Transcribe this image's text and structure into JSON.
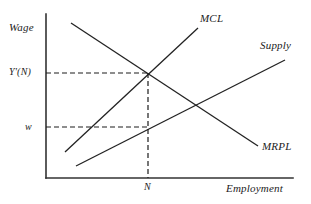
{
  "figure": {
    "type": "economics-diagram",
    "background_color": "#ffffff",
    "line_color": "#222222"
  },
  "axes": {
    "y_axis_label": "Wage",
    "x_axis_label": "Employment",
    "origin": {
      "x": 46,
      "y": 178
    },
    "y_axis_top": {
      "x": 46,
      "y": 14
    },
    "x_axis_right": {
      "x": 293,
      "y": 178
    }
  },
  "curves": [
    {
      "name": "MCL",
      "label": "MCL",
      "description": "marginal cost of labour, upward sloping, steep",
      "x1": 65,
      "y1": 152,
      "x2": 198,
      "y2": 28,
      "label_x": 200,
      "label_y": 13
    },
    {
      "name": "Supply",
      "label": "Supply",
      "description": "labour supply curve, upward sloping, shallow",
      "x1": 76,
      "y1": 166,
      "x2": 285,
      "y2": 60,
      "label_x": 260,
      "label_y": 40
    },
    {
      "name": "MRPL",
      "label": "MRPL",
      "description": "marginal revenue product of labour, downward sloping",
      "x1": 71,
      "y1": 23,
      "x2": 258,
      "y2": 146,
      "label_x": 262,
      "label_y": 141
    }
  ],
  "equilibrium": {
    "wage_level_label": "Y'(N)",
    "wage_level_y": 73,
    "wage_paid_label": "w",
    "wage_paid_y": 127,
    "employment_label": "N",
    "employment_x": 148,
    "intersection": {
      "x": 148,
      "y": 73
    },
    "supply_point": {
      "x": 148,
      "y": 127
    }
  },
  "guides": [
    {
      "name": "wage-level-guide",
      "orientation": "horizontal",
      "x1": 46,
      "y1": 73,
      "x2": 148,
      "y2": 73
    },
    {
      "name": "wage-paid-guide",
      "orientation": "horizontal",
      "x1": 46,
      "y1": 127,
      "x2": 148,
      "y2": 127
    },
    {
      "name": "employment-guide",
      "orientation": "vertical",
      "x1": 148,
      "y1": 73,
      "x2": 148,
      "y2": 178
    }
  ],
  "tick_labels": {
    "y_upper": "Y'(N)",
    "y_lower": "w",
    "x_point": "N"
  }
}
